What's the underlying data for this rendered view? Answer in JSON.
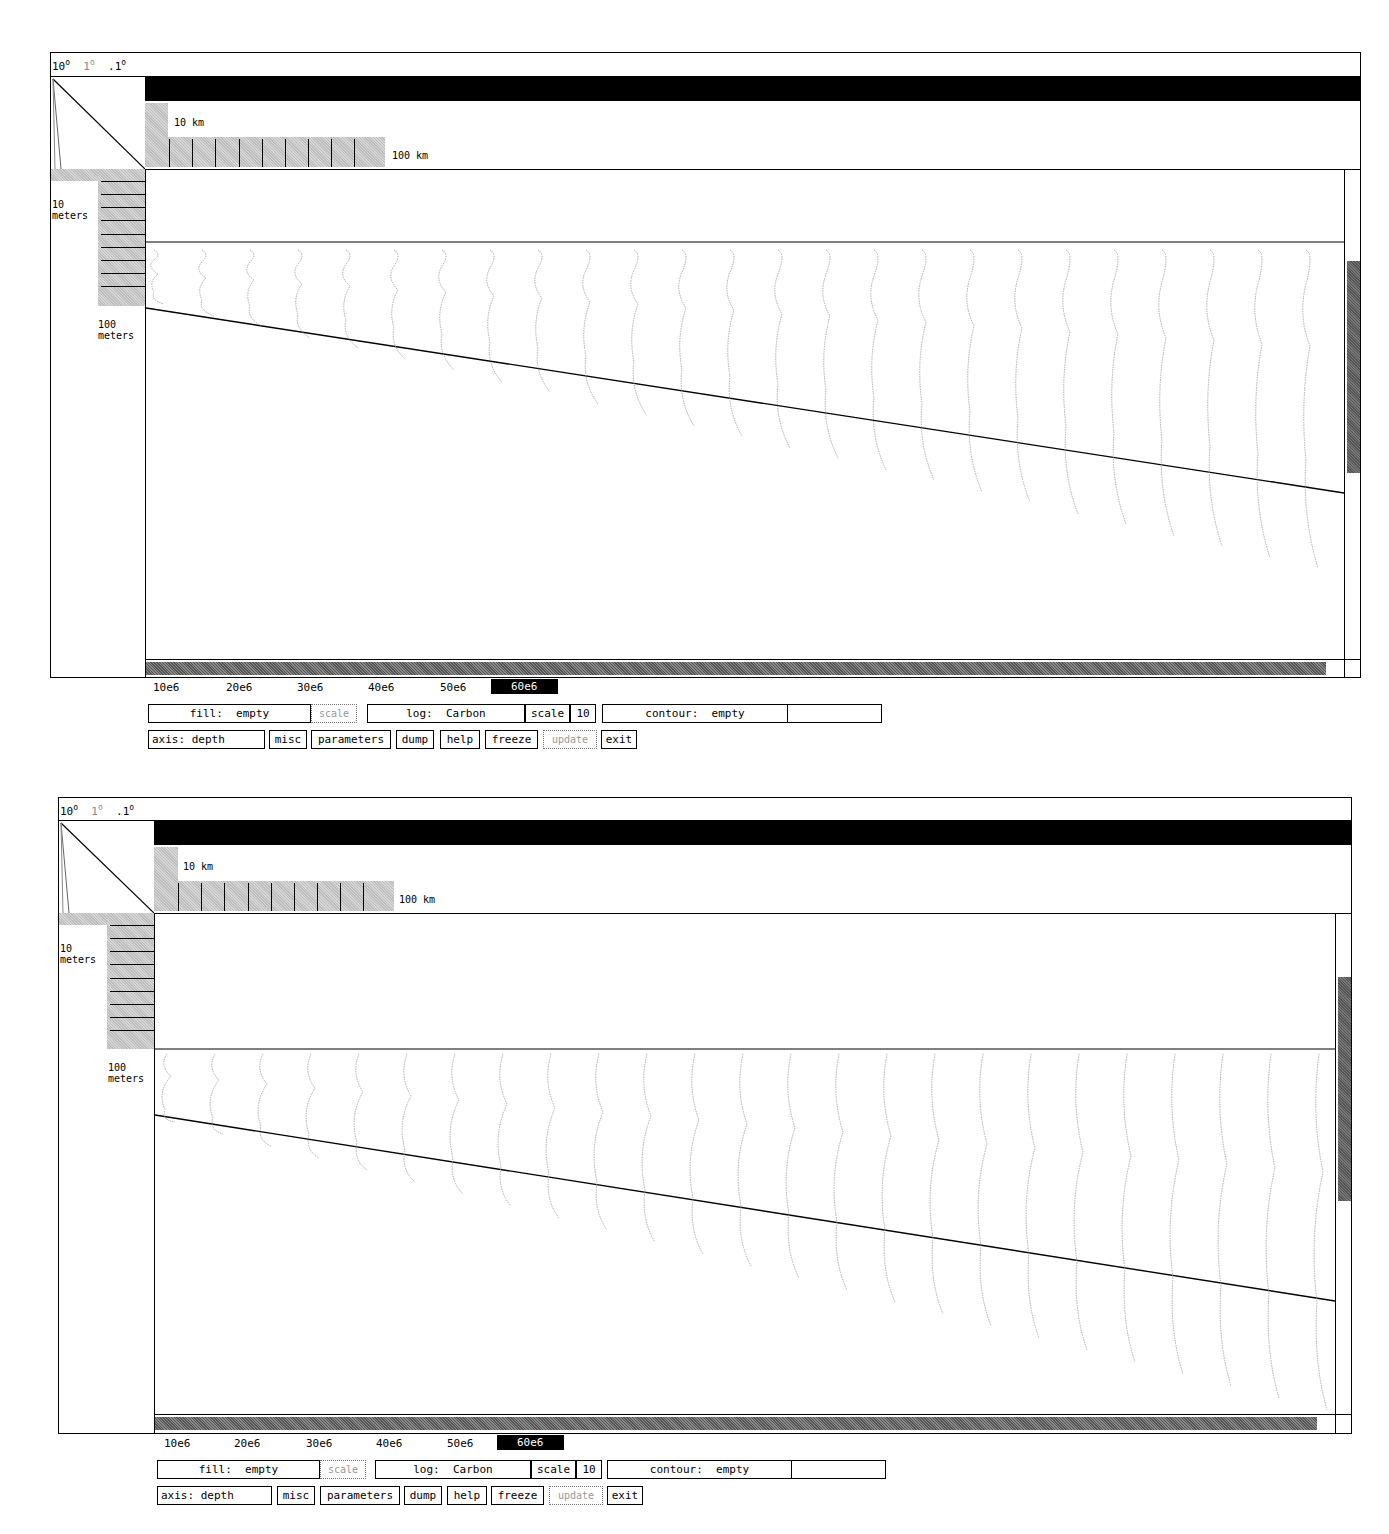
{
  "panels": [
    {
      "id": "top",
      "zoom_levels": {
        "a": "10",
        "b": "1",
        "c": ".1",
        "degree": "o"
      },
      "scale_bar": {
        "small_label": "10 km",
        "large_label": "100 km"
      },
      "depth_ruler": {
        "small_label_1": "10",
        "small_label_2": "meters",
        "large_label_1": "100",
        "large_label_2": "meters"
      },
      "time_axis": [
        "10e6",
        "20e6",
        "30e6",
        "40e6",
        "50e6",
        "60e6"
      ],
      "time_selected": "60e6",
      "controls": {
        "fill": "fill:  empty",
        "fill_scale": "scale",
        "log": "log:  Carbon",
        "log_scale": "scale",
        "log_scale_value": "10",
        "contour": "contour:  empty",
        "contour_value": "",
        "axis": "axis: depth",
        "misc": "misc",
        "parameters": "parameters",
        "dump": "dump",
        "help": "help",
        "freeze": "freeze",
        "update": "update",
        "exit": "exit"
      }
    },
    {
      "id": "bottom",
      "zoom_levels": {
        "a": "10",
        "b": "1",
        "c": ".1",
        "degree": "o"
      },
      "scale_bar": {
        "small_label": "10 km",
        "large_label": "100 km"
      },
      "depth_ruler": {
        "small_label_1": "10",
        "small_label_2": "meters",
        "large_label_1": "100",
        "large_label_2": "meters"
      },
      "time_axis": [
        "10e6",
        "20e6",
        "30e6",
        "40e6",
        "50e6",
        "60e6"
      ],
      "time_selected": "60e6",
      "controls": {
        "fill": "fill:  empty",
        "fill_scale": "scale",
        "log": "log:  Carbon",
        "log_scale": "scale",
        "log_scale_value": "10",
        "contour": "contour:  empty",
        "contour_value": "",
        "axis": "axis: depth",
        "misc": "misc",
        "parameters": "parameters",
        "dump": "dump",
        "help": "help",
        "freeze": "freeze",
        "update": "update",
        "exit": "exit"
      }
    }
  ]
}
